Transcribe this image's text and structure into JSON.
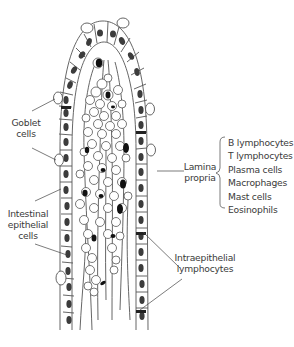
{
  "diagram": {
    "labels": {
      "goblet": [
        "Goblet",
        "cells"
      ],
      "lamina": [
        "Lamina",
        "propria"
      ],
      "epithelial": [
        "Intestinal",
        "epithelial",
        "cells"
      ],
      "intraepithelial": [
        "Intraepithelial",
        "lymphocytes"
      ]
    },
    "lamina_propria_cells": [
      "B lymphocytes",
      "T lymphocytes",
      "Plasma cells",
      "Macrophages",
      "Mast cells",
      "Eosinophils"
    ],
    "colors": {
      "line": "#555555",
      "nucleus": "#3c3c3c",
      "dark_nucleus": "#111111",
      "text": "#3a3a3a"
    }
  }
}
